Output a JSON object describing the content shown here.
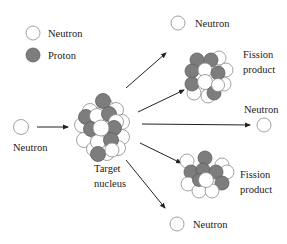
{
  "legend": {
    "neutron_label": "Neutron",
    "proton_label": "Proton"
  },
  "labels": {
    "incoming_neutron": "Neutron",
    "target_line1": "Target",
    "target_line2": "nucleus",
    "top_neutron": "Neutron",
    "top_fission_line1": "Fission",
    "top_fission_line2": "product",
    "right_neutron": "Neutron",
    "bottom_fission_line1": "Fission",
    "bottom_fission_line2": "product",
    "bottom_neutron": "Neutron"
  },
  "colors": {
    "neutron_fill": "#ffffff",
    "proton_fill": "#7d7d7d",
    "outline": "#8a8a8a",
    "arrow": "#222222"
  }
}
